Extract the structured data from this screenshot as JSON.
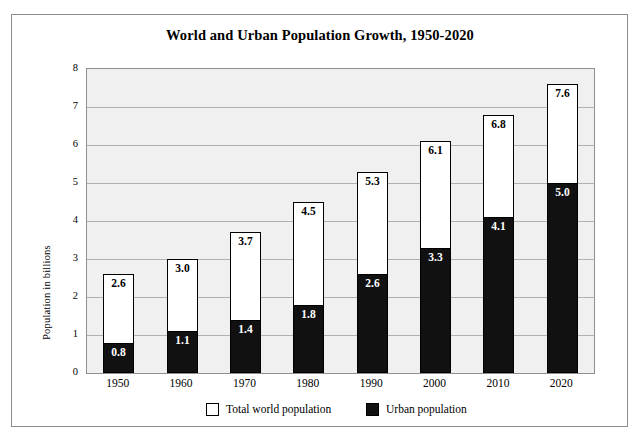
{
  "chart_data": {
    "type": "bar",
    "subtype": "overlaid-two-series",
    "title": "World and Urban Population Growth, 1950-2020",
    "xlabel": "",
    "ylabel": "Population in billions",
    "ylim": [
      0,
      8
    ],
    "ytick_labels": [
      "0",
      "1",
      "2",
      "3",
      "4",
      "5",
      "6",
      "7",
      "8"
    ],
    "ytick_values": [
      0,
      1,
      2,
      3,
      4,
      5,
      6,
      7,
      8
    ],
    "grid": true,
    "grid_axis": "y",
    "legend_position": "bottom-center",
    "categories": [
      "1950",
      "1960",
      "1970",
      "1980",
      "1990",
      "2000",
      "2010",
      "2020"
    ],
    "series": [
      {
        "name": "Total world population",
        "color": "#ffffff",
        "edge_color": "#000000",
        "values": [
          2.6,
          3.0,
          3.7,
          4.5,
          5.3,
          6.1,
          6.8,
          7.6
        ],
        "labels": [
          "2.6",
          "3.0",
          "3.7",
          "4.5",
          "5.3",
          "6.1",
          "6.8",
          "7.6"
        ]
      },
      {
        "name": "Urban population",
        "color": "#111111",
        "edge_color": "#000000",
        "values": [
          0.8,
          1.1,
          1.4,
          1.8,
          2.6,
          3.3,
          4.1,
          5.0
        ],
        "labels": [
          "0.8",
          "1.1",
          "1.4",
          "1.8",
          "2.6",
          "3.3",
          "4.1",
          "5.0"
        ]
      }
    ]
  },
  "legend": {
    "items": [
      {
        "label": "Total world population",
        "swatch": "white-square-swatch"
      },
      {
        "label": "Urban population",
        "swatch": "black-square-swatch"
      }
    ]
  },
  "style": {
    "plot_background": "#f0f0f0",
    "gridline_color": "#b0b0b0",
    "frame_color": "#8c8c8c",
    "text_color": "#000000"
  }
}
